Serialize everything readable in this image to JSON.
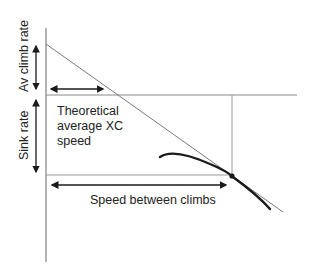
{
  "diagram": {
    "labels": {
      "climb_rate": "Av climb rate",
      "sink_rate": "Sink rate",
      "xc_speed_line1": "Theoretical",
      "xc_speed_line2": "average XC",
      "xc_speed_line3": "speed",
      "speed_between_climbs": "Speed between climbs"
    },
    "colors": {
      "axis": "#8a8a8a",
      "thin_lines": "#7a7a7a",
      "polar_curve": "#1a1a1a",
      "arrows": "#1a1a1a",
      "text": "#222222"
    }
  }
}
